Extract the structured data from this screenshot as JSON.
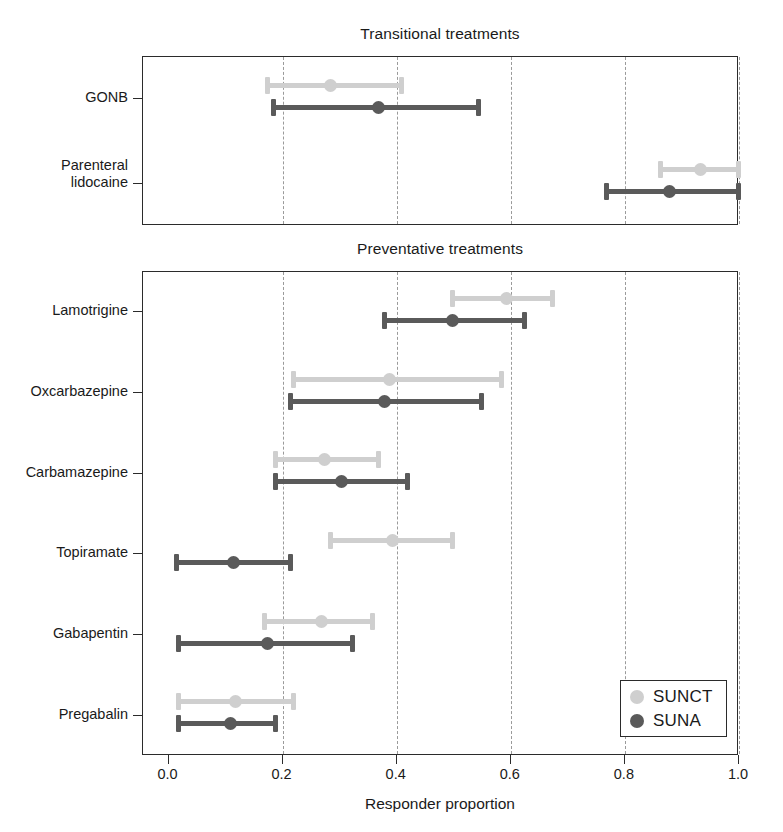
{
  "figure": {
    "clipped_header_text": "",
    "xaxis_title": "Responder proportion",
    "xticks": [
      "0.0",
      "0.2",
      "0.4",
      "0.6",
      "0.8",
      "1.0"
    ],
    "xlim": [
      0.0,
      1.0
    ],
    "legend": {
      "entries": [
        {
          "label": "SUNCT",
          "color": "#cfcfcf"
        },
        {
          "label": "SUNA",
          "color": "#5a5a5a"
        }
      ]
    },
    "panels": [
      {
        "title": "Transitional treatments"
      },
      {
        "title": "Preventative treatments"
      }
    ]
  },
  "chart_data": {
    "type": "scatter",
    "title": "",
    "xlabel": "Responder proportion",
    "ylabel": "",
    "xlim": [
      0.0,
      1.0
    ],
    "xticks": [
      0.0,
      0.2,
      0.4,
      0.6,
      0.8,
      1.0
    ],
    "grid": "vertical-dashed",
    "legend_position": "bottom-right",
    "series": [
      {
        "name": "SUNCT",
        "color": "#cfcfcf"
      },
      {
        "name": "SUNA",
        "color": "#5a5a5a"
      }
    ],
    "panels": [
      {
        "title": "Transitional treatments",
        "categories": [
          "GONB",
          "Parenteral lidocaine"
        ],
        "points": [
          {
            "category": "GONB",
            "SUNCT": {
              "estimate": 0.285,
              "low": 0.175,
              "high": 0.41
            },
            "SUNA": {
              "estimate": 0.37,
              "low": 0.185,
              "high": 0.545
            }
          },
          {
            "category": "Parenteral lidocaine",
            "SUNCT": {
              "estimate": 0.935,
              "low": 0.865,
              "high": 1.0
            },
            "SUNA": {
              "estimate": 0.88,
              "low": 0.77,
              "high": 1.0
            }
          }
        ]
      },
      {
        "title": "Preventative treatments",
        "categories": [
          "Lamotrigine",
          "Oxcarbazepine",
          "Carbamazepine",
          "Topiramate",
          "Gabapentin",
          "Pregabalin"
        ],
        "points": [
          {
            "category": "Lamotrigine",
            "SUNCT": {
              "estimate": 0.595,
              "low": 0.5,
              "high": 0.675
            },
            "SUNA": {
              "estimate": 0.5,
              "low": 0.38,
              "high": 0.625
            }
          },
          {
            "category": "Oxcarbazepine",
            "SUNCT": {
              "estimate": 0.39,
              "low": 0.22,
              "high": 0.585
            },
            "SUNA": {
              "estimate": 0.38,
              "low": 0.215,
              "high": 0.55
            }
          },
          {
            "category": "Carbamazepine",
            "SUNCT": {
              "estimate": 0.275,
              "low": 0.19,
              "high": 0.37
            },
            "SUNA": {
              "estimate": 0.305,
              "low": 0.19,
              "high": 0.42
            }
          },
          {
            "category": "Topiramate",
            "SUNCT": {
              "estimate": 0.395,
              "low": 0.285,
              "high": 0.5
            },
            "SUNA": {
              "estimate": 0.115,
              "low": 0.015,
              "high": 0.215
            }
          },
          {
            "category": "Gabapentin",
            "SUNCT": {
              "estimate": 0.27,
              "low": 0.17,
              "high": 0.36
            },
            "SUNA": {
              "estimate": 0.175,
              "low": 0.02,
              "high": 0.325
            }
          },
          {
            "category": "Pregabalin",
            "SUNCT": {
              "estimate": 0.12,
              "low": 0.02,
              "high": 0.22
            },
            "SUNA": {
              "estimate": 0.11,
              "low": 0.02,
              "high": 0.19
            }
          }
        ]
      }
    ]
  }
}
